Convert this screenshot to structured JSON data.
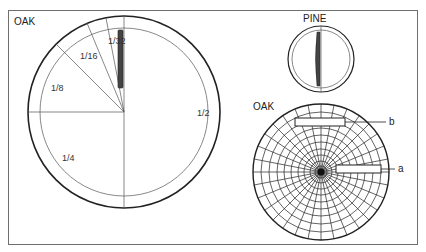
{
  "figure": {
    "top_caption_partial": "…",
    "panels": [
      {
        "id": "oak-large",
        "title": "OAK",
        "sectors": [
          {
            "label": "1/32"
          },
          {
            "label": "1/16"
          },
          {
            "label": "1/8"
          },
          {
            "label": "1/4"
          },
          {
            "label": "1/2"
          }
        ]
      },
      {
        "id": "pine",
        "title": "PINE"
      },
      {
        "id": "oak-small",
        "title": "OAK",
        "callouts": [
          {
            "label": "b"
          },
          {
            "label": "a"
          }
        ]
      }
    ]
  }
}
